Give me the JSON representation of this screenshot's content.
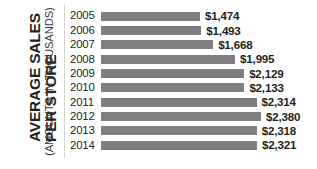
{
  "axis_title": {
    "main_lines": [
      "AVERAGE SALES",
      "PER STORE"
    ],
    "subtitle": "(AMOUNTS IN THOUSANDS)"
  },
  "colors": {
    "bar": "#808083",
    "text": "#231f20",
    "divider": "#d4d4d6",
    "background": "#ffffff"
  },
  "chart_data": {
    "type": "bar",
    "orientation": "horizontal",
    "title": "AVERAGE SALES PER STORE",
    "subtitle": "(AMOUNTS IN THOUSANDS)",
    "xlabel": "",
    "ylabel": "AVERAGE SALES PER STORE",
    "grid": false,
    "legend": "none",
    "xlim": [
      0,
      2380
    ],
    "categories": [
      "2005",
      "2006",
      "2007",
      "2008",
      "2009",
      "2010",
      "2011",
      "2012",
      "2013",
      "2014"
    ],
    "values": [
      1474,
      1493,
      1668,
      1995,
      2129,
      2133,
      2314,
      2380,
      2318,
      2321
    ],
    "value_labels": [
      "$1,474",
      "$1,493",
      "$1,668",
      "$1,995",
      "$2,129",
      "$2,133",
      "$2,314",
      "$2,380",
      "$2,318",
      "$2,321"
    ],
    "bar_color": "#808083"
  },
  "rows": [
    {
      "year": "2005",
      "value": 1474,
      "label": "$1,474"
    },
    {
      "year": "2006",
      "value": 1493,
      "label": "$1,493"
    },
    {
      "year": "2007",
      "value": 1668,
      "label": "$1,668"
    },
    {
      "year": "2008",
      "value": 1995,
      "label": "$1,995"
    },
    {
      "year": "2009",
      "value": 2129,
      "label": "$2,129"
    },
    {
      "year": "2010",
      "value": 2133,
      "label": "$2,133"
    },
    {
      "year": "2011",
      "value": 2314,
      "label": "$2,314"
    },
    {
      "year": "2012",
      "value": 2380,
      "label": "$2,380"
    },
    {
      "year": "2013",
      "value": 2318,
      "label": "$2,318"
    },
    {
      "year": "2014",
      "value": 2321,
      "label": "$2,321"
    }
  ]
}
